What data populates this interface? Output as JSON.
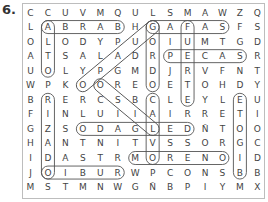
{
  "exercise_number": "6.",
  "grid": {
    "cols": 14,
    "rows": 13,
    "letters": [
      [
        "C",
        "C",
        "U",
        "V",
        "M",
        "Q",
        "U",
        "L",
        "S",
        "M",
        "A",
        "W",
        "Z",
        "Q"
      ],
      [
        "L",
        "A",
        "B",
        "R",
        "A",
        "B",
        "H",
        "G",
        "A",
        "F",
        "A",
        "S",
        "F",
        "S"
      ],
      [
        "O",
        "L",
        "O",
        "D",
        "Y",
        "P",
        "U",
        "O",
        "I",
        "U",
        "M",
        "T",
        "G",
        "D"
      ],
      [
        "A",
        "T",
        "S",
        "A",
        "L",
        "A",
        "D",
        "R",
        "P",
        "E",
        "C",
        "A",
        "S",
        "R"
      ],
      [
        "U",
        "O",
        "L",
        "Y",
        "P",
        "G",
        "M",
        "D",
        "J",
        "R",
        "V",
        "F",
        "N",
        "T"
      ],
      [
        "W",
        "P",
        "K",
        "O",
        "O",
        "R",
        "E",
        "O",
        "E",
        "T",
        "O",
        "H",
        "D",
        "Y"
      ],
      [
        "B",
        "R",
        "E",
        "R",
        "C",
        "S",
        "B",
        "C",
        "L",
        "E",
        "Y",
        "L",
        "E",
        "U"
      ],
      [
        "F",
        "I",
        "N",
        "L",
        "U",
        "I",
        "I",
        "A",
        "I",
        "R",
        "R",
        "E",
        "T",
        "I"
      ],
      [
        "G",
        "Z",
        "S",
        "O",
        "D",
        "A",
        "G",
        "L",
        "E",
        "D",
        "Ñ",
        "T",
        "O",
        "O"
      ],
      [
        "H",
        "A",
        "N",
        "T",
        "N",
        "I",
        "T",
        "V",
        "S",
        "S",
        "O",
        "R",
        "G",
        "C"
      ],
      [
        "I",
        "D",
        "A",
        "S",
        "T",
        "R",
        "M",
        "O",
        "R",
        "E",
        "N",
        "O",
        "I",
        "D"
      ],
      [
        "J",
        "O",
        "I",
        "B",
        "U",
        "R",
        "W",
        "P",
        "C",
        "O",
        "N",
        "S",
        "B",
        "B"
      ],
      [
        "M",
        "S",
        "T",
        "M",
        "N",
        "W",
        "G",
        "Ñ",
        "B",
        "P",
        "I",
        "Y",
        "M",
        "X"
      ]
    ]
  },
  "found_words": [
    {
      "word": "BARBA",
      "start": [
        1,
        1
      ],
      "end": [
        1,
        5
      ],
      "direction": "horizontal-reversed"
    },
    {
      "word": "GAFAS",
      "start": [
        1,
        7
      ],
      "end": [
        1,
        11
      ],
      "direction": "horizontal"
    },
    {
      "word": "PECAS",
      "start": [
        3,
        8
      ],
      "end": [
        3,
        12
      ],
      "direction": "horizontal"
    },
    {
      "word": "DELGADO",
      "start": [
        8,
        3
      ],
      "end": [
        8,
        9
      ],
      "direction": "horizontal-reversed"
    },
    {
      "word": "MORENO",
      "start": [
        10,
        6
      ],
      "end": [
        10,
        11
      ],
      "direction": "horizontal"
    },
    {
      "word": "RUBIO",
      "start": [
        11,
        1
      ],
      "end": [
        11,
        5
      ],
      "direction": "horizontal-reversed"
    },
    {
      "word": "ALTO",
      "start": [
        1,
        1
      ],
      "end": [
        4,
        1
      ],
      "direction": "vertical"
    },
    {
      "word": "RIZADO",
      "start": [
        6,
        1
      ],
      "end": [
        11,
        1
      ],
      "direction": "vertical"
    },
    {
      "word": "GORDO",
      "start": [
        1,
        7
      ],
      "end": [
        5,
        7
      ],
      "direction": "vertical"
    },
    {
      "word": "FUERTE",
      "start": [
        1,
        9
      ],
      "end": [
        6,
        9
      ],
      "direction": "vertical"
    },
    {
      "word": "CALVO",
      "start": [
        6,
        7
      ],
      "end": [
        10,
        7
      ],
      "direction": "vertical"
    },
    {
      "word": "BIGOTE",
      "start": [
        6,
        12
      ],
      "end": [
        11,
        12
      ],
      "direction": "vertical-reversed"
    },
    {
      "word": "GUAPO",
      "start": [
        1,
        7
      ],
      "end": [
        5,
        3
      ],
      "direction": "diagonal"
    },
    {
      "word": "LISO",
      "start": [
        5,
        4
      ],
      "end": [
        8,
        7
      ],
      "direction": "diagonal-reversed"
    }
  ]
}
